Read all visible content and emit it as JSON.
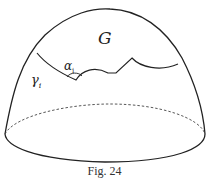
{
  "figure": {
    "labels": {
      "region": "G",
      "angle": "α",
      "angle_sub": "i",
      "curve": "γ",
      "curve_sub": "i"
    },
    "caption": "Fig. 24",
    "colors": {
      "stroke": "#222222",
      "background": "#ffffff"
    }
  }
}
